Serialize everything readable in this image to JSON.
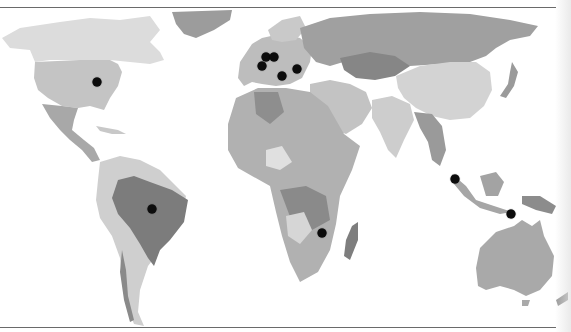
{
  "map": {
    "type": "world-choropleth-grayscale",
    "colors": {
      "ocean": "#ffffff",
      "land_light": "#d9d9d9",
      "land_mid": "#b3b3b3",
      "land_dark": "#8f8f8f",
      "land_darker": "#7a7a7a",
      "marker": "#0c0c0c",
      "frame_rule": "#6a6a6a"
    },
    "markers": [
      {
        "region": "United States (Midwest)",
        "x": 97,
        "y": 82
      },
      {
        "region": "Western Europe (UK/Netherlands)",
        "x": 266,
        "y": 57
      },
      {
        "region": "Western Europe (Germany)",
        "x": 274,
        "y": 57
      },
      {
        "region": "Western Europe (France)",
        "x": 262,
        "y": 66
      },
      {
        "region": "Eastern Europe",
        "x": 297,
        "y": 69
      },
      {
        "region": "Central Europe (Italy/Balkans)",
        "x": 282,
        "y": 76
      },
      {
        "region": "Brazil",
        "x": 152,
        "y": 209
      },
      {
        "region": "Southern Africa",
        "x": 322,
        "y": 233
      },
      {
        "region": "Sumatra / Malaysia",
        "x": 455,
        "y": 179
      },
      {
        "region": "Eastern Indonesia",
        "x": 511,
        "y": 214
      }
    ]
  }
}
